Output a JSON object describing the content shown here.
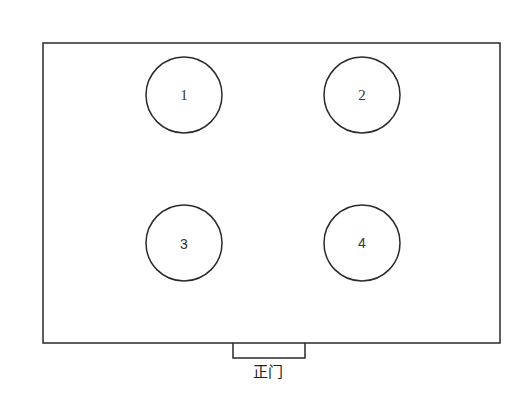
{
  "diagram": {
    "type": "floor-plan",
    "room": {
      "x": 43,
      "y": 43,
      "width": 457,
      "height": 300
    },
    "door": {
      "x": 233,
      "y": 343,
      "width": 72,
      "height": 15,
      "label": "正门"
    },
    "circles": [
      {
        "id": "1",
        "label": "1",
        "cx": 184,
        "cy": 95,
        "r": 38
      },
      {
        "id": "2",
        "label": "2",
        "cx": 362,
        "cy": 95,
        "r": 38
      },
      {
        "id": "3",
        "label": "3",
        "cx": 184,
        "cy": 243,
        "r": 38
      },
      {
        "id": "4",
        "label": "4",
        "cx": 362,
        "cy": 243,
        "r": 38
      }
    ]
  }
}
